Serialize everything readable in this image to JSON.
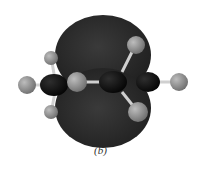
{
  "figure": {
    "caption": "(b)",
    "colors": {
      "lobe": "#2a2a2a",
      "carbon": "#111111",
      "hydrogen": "#8a8a8a",
      "bond": "#cfcfcf",
      "background": "#ffffff"
    }
  }
}
